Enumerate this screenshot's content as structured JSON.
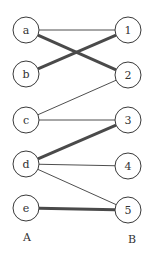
{
  "diagram": {
    "type": "bipartite-graph-matching",
    "colors": {
      "stroke": "#3a3a3a",
      "thick": "#4a4a4a",
      "background": "#ffffff"
    },
    "partitions": [
      {
        "id": "A",
        "label": "A",
        "label_pos": [
          27,
          241
        ]
      },
      {
        "id": "B",
        "label": "B",
        "label_pos": [
          132,
          243
        ]
      }
    ],
    "nodes": [
      {
        "id": "a",
        "label": "a",
        "side": "A",
        "cx": 26,
        "cy": 30
      },
      {
        "id": "b",
        "label": "b",
        "side": "A",
        "cx": 26,
        "cy": 74
      },
      {
        "id": "c",
        "label": "c",
        "side": "A",
        "cx": 26,
        "cy": 120
      },
      {
        "id": "d",
        "label": "d",
        "side": "A",
        "cx": 26,
        "cy": 164
      },
      {
        "id": "e",
        "label": "e",
        "side": "A",
        "cx": 26,
        "cy": 208
      },
      {
        "id": "1",
        "label": "1",
        "side": "B",
        "cx": 128,
        "cy": 30
      },
      {
        "id": "2",
        "label": "2",
        "side": "B",
        "cx": 128,
        "cy": 75
      },
      {
        "id": "3",
        "label": "3",
        "side": "B",
        "cx": 128,
        "cy": 120
      },
      {
        "id": "4",
        "label": "4",
        "side": "B",
        "cx": 128,
        "cy": 166
      },
      {
        "id": "5",
        "label": "5",
        "side": "B",
        "cx": 128,
        "cy": 210
      }
    ],
    "node_radius": 13,
    "edges": [
      {
        "from": "a",
        "to": "1",
        "matched": false
      },
      {
        "from": "a",
        "to": "2",
        "matched": true
      },
      {
        "from": "b",
        "to": "1",
        "matched": true
      },
      {
        "from": "c",
        "to": "2",
        "matched": false
      },
      {
        "from": "c",
        "to": "3",
        "matched": false
      },
      {
        "from": "d",
        "to": "3",
        "matched": true
      },
      {
        "from": "d",
        "to": "4",
        "matched": false
      },
      {
        "from": "d",
        "to": "5",
        "matched": false
      },
      {
        "from": "e",
        "to": "5",
        "matched": true
      }
    ]
  }
}
